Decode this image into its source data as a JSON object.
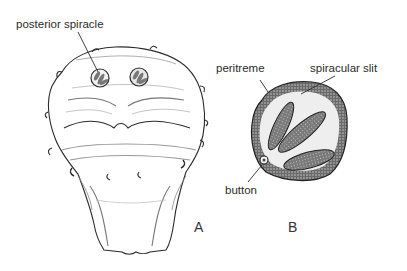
{
  "figure": {
    "panels": [
      {
        "id": "A",
        "letter": "A",
        "description": "posterior view of larval segment with paired posterior spiracles",
        "labels": [
          {
            "text": "posterior spiracle",
            "target": "left posterior spiracle"
          }
        ]
      },
      {
        "id": "B",
        "letter": "B",
        "description": "enlarged posterior spiracle",
        "labels": [
          {
            "text": "peritreme",
            "target": "outer dark rim"
          },
          {
            "text": "spiracular slit",
            "target": "upper slit"
          },
          {
            "text": "button",
            "target": "small ring at lower-left of rim"
          }
        ]
      }
    ],
    "colors": {
      "background": "#ffffff",
      "ink": "#2b2b2b",
      "shade": "#8a8a8a",
      "peritreme": "#3a3a3a"
    }
  }
}
